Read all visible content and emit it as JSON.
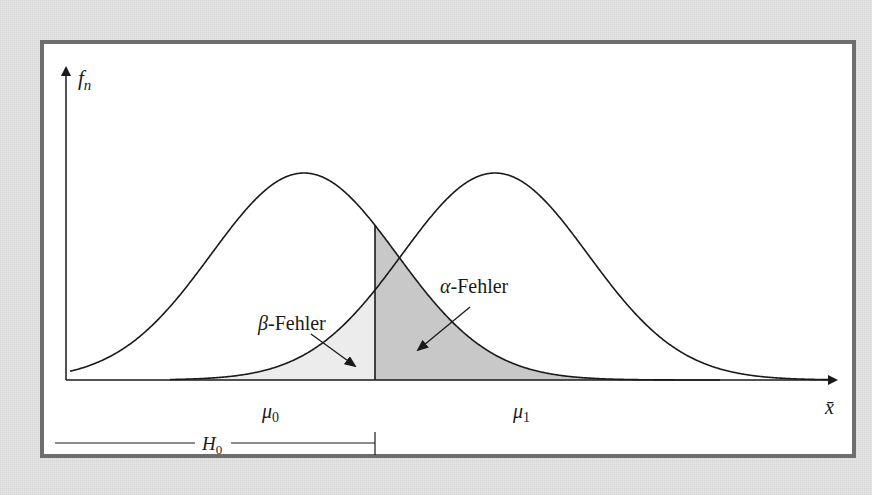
{
  "figure": {
    "background_color": "#e6e6e6",
    "panel_border_color": "#6e6e6e",
    "shade_alpha_color": "#c8c8c8",
    "shade_beta_color": "#ececec",
    "line_color": "#1a1a1a"
  },
  "axes": {
    "y_label": "f",
    "y_label_sub": "n",
    "x_label": "x̄"
  },
  "distributions": [
    {
      "name": "H0",
      "mean_label": "μ",
      "mean_sub": "0"
    },
    {
      "name": "H1",
      "mean_label": "μ",
      "mean_sub": "1"
    }
  ],
  "annotations": {
    "alpha_error_greek": "α",
    "alpha_error_text": "-Fehler",
    "beta_error_greek": "β",
    "beta_error_text": "-Fehler",
    "h0_region_label": "H",
    "h0_region_sub": "0"
  },
  "chart_data": {
    "type": "line",
    "title": "",
    "xlabel": "x̄",
    "ylabel": "f_n",
    "series": [
      {
        "name": "H0 density (μ0)",
        "mean_px": 304,
        "sigma_px": 93,
        "peak_y_px": 173
      },
      {
        "name": "H1 density (μ1)",
        "mean_px": 495,
        "sigma_px": 93,
        "peak_y_px": 173
      }
    ],
    "critical_value_px": 375,
    "baseline_y_px": 380,
    "shaded_regions": [
      {
        "name": "α-Fehler",
        "description": "area under H0 curve to the right of critical value"
      },
      {
        "name": "β-Fehler",
        "description": "area under H1 curve to the left of critical value"
      }
    ],
    "grid": false,
    "legend": "none"
  }
}
